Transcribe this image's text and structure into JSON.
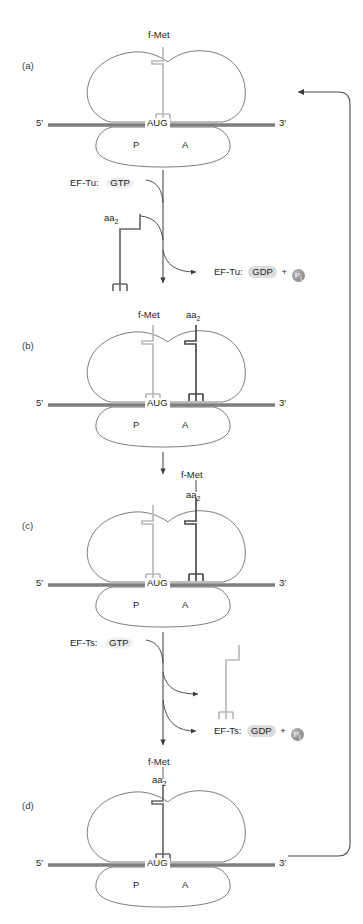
{
  "figure": {
    "type": "translation-elongation-cycle-diagram",
    "background": "#ffffff",
    "colors": {
      "mrna": "#7e7e7e",
      "ribosome_outline": "#6e6e6e",
      "trna_dark": "#4a4a4a",
      "trna_light": "#b9b9b9",
      "arrow": "#3a3a3a",
      "pill": "#dcdcdc",
      "text": "#231f20"
    }
  },
  "panels": [
    {
      "id": "a",
      "label": "(a)",
      "five_prime": "5′",
      "three_prime": "3′",
      "codon": "AUG",
      "site_p": "P",
      "site_a": "A",
      "trnas": [
        {
          "site": "P",
          "cargo": "f-Met",
          "shade": "light"
        }
      ]
    },
    {
      "id": "b",
      "label": "(b)",
      "five_prime": "5′",
      "three_prime": "3′",
      "codon": "AUG",
      "site_p": "P",
      "site_a": "A",
      "trnas": [
        {
          "site": "P",
          "cargo": "f-Met",
          "shade": "light"
        },
        {
          "site": "A",
          "cargo": "aa",
          "cargo_sub": "2",
          "shade": "dark"
        }
      ]
    },
    {
      "id": "c",
      "label": "(c)",
      "five_prime": "5′",
      "three_prime": "3′",
      "codon": "AUG",
      "site_p": "P",
      "site_a": "A",
      "trnas": [
        {
          "site": "P",
          "cargo": "",
          "shade": "light"
        },
        {
          "site": "A",
          "cargo": "f-Met",
          "cargo2": "aa",
          "cargo2_sub": "2",
          "shade": "dark"
        }
      ]
    },
    {
      "id": "d",
      "label": "(d)",
      "five_prime": "5′",
      "three_prime": "3′",
      "codon": "AUG",
      "site_p": "P",
      "site_a": "A",
      "trnas": [
        {
          "site": "P",
          "cargo": "f-Met",
          "cargo2": "aa",
          "cargo2_sub": "2",
          "shade": "dark"
        }
      ]
    }
  ],
  "steps": {
    "step1": {
      "factor_in_label": "EF-Tu:",
      "factor_in_nucleotide": "GTP",
      "incoming_trna_label": "aa",
      "incoming_trna_sub": "2",
      "factor_out_label": "EF-Tu:",
      "factor_out_nucleotide": "GDP",
      "plus": "+",
      "phosphate": "P",
      "phosphate_sub": "i"
    },
    "step2": {
      "factor_in_label": "EF-Ts:",
      "factor_in_nucleotide": "GTP",
      "factor_out_label": "EF-Ts:",
      "factor_out_nucleotide": "GDP",
      "plus": "+",
      "phosphate": "P",
      "phosphate_sub": "i"
    }
  },
  "labels": {
    "f_met": "f-Met",
    "aa2_main": "aa",
    "aa2_sub": "2"
  }
}
